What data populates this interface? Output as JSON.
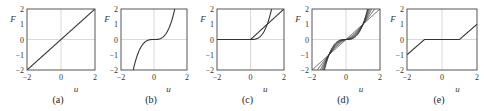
{
  "chart_data": [
    {
      "panel": "(a)",
      "type": "line",
      "xlabel": "u",
      "ylabel": "F",
      "xlim": [
        -2,
        2
      ],
      "ylim": [
        -2,
        2
      ],
      "xticks": [
        "-2",
        "0",
        "2"
      ],
      "yticks": [
        "2",
        "1",
        "0",
        "-1",
        "-2"
      ],
      "grid": "zero-lines",
      "series": [
        {
          "name": "linear",
          "formula": "F = u",
          "x": [
            -2,
            2
          ],
          "y": [
            -2,
            2
          ]
        }
      ]
    },
    {
      "panel": "(b)",
      "type": "line",
      "xlabel": "u",
      "ylabel": "F",
      "xlim": [
        -2,
        2
      ],
      "ylim": [
        -2,
        2
      ],
      "xticks": [
        "-2",
        "0",
        "2"
      ],
      "yticks": [
        "2",
        "1",
        "0",
        "-1",
        "-2"
      ],
      "grid": "zero-lines",
      "series": [
        {
          "name": "cubic",
          "formula": "F = u^3",
          "x": [
            -1.26,
            -1,
            -0.5,
            0,
            0.5,
            1,
            1.26
          ],
          "y": [
            -2,
            -1,
            -0.125,
            0,
            0.125,
            1,
            2
          ]
        }
      ]
    },
    {
      "panel": "(c)",
      "type": "line",
      "xlabel": "u",
      "ylabel": "F",
      "xlim": [
        -2,
        2
      ],
      "ylim": [
        -2,
        2
      ],
      "xticks": [
        "-2",
        "0",
        "2"
      ],
      "yticks": [
        "2",
        "1",
        "0",
        "-1",
        "-2"
      ],
      "grid": "zero-lines",
      "series": [
        {
          "name": "rectified linear",
          "formula": "F = max(0,u)",
          "x": [
            -2,
            0,
            2
          ],
          "y": [
            0,
            0,
            2
          ]
        },
        {
          "name": "rectified cubic",
          "formula": "F = max(0,u)^3",
          "x": [
            -2,
            0,
            0.5,
            1,
            1.26
          ],
          "y": [
            0,
            0,
            0.125,
            1,
            2
          ]
        }
      ]
    },
    {
      "panel": "(d)",
      "type": "line",
      "xlabel": "u",
      "ylabel": "F",
      "xlim": [
        -2,
        2
      ],
      "ylim": [
        -2,
        2
      ],
      "xticks": [
        "-2",
        "0",
        "2"
      ],
      "yticks": [
        "2",
        "1",
        "0",
        "-1",
        "-2"
      ],
      "grid": "zero-lines",
      "series": [
        {
          "name": "p=1",
          "exponent": 1
        },
        {
          "name": "p=1.33",
          "exponent": 1.33
        },
        {
          "name": "p=1.67",
          "exponent": 1.67
        },
        {
          "name": "p=2",
          "exponent": 2
        },
        {
          "name": "p=2.33",
          "exponent": 2.33
        },
        {
          "name": "p=2.67",
          "exponent": 2.67
        },
        {
          "name": "p=3",
          "exponent": 3
        }
      ],
      "formula": "F = sign(u)|u|^p"
    },
    {
      "panel": "(e)",
      "type": "line",
      "xlabel": "u",
      "ylabel": "F",
      "xlim": [
        -2,
        2
      ],
      "ylim": [
        -2,
        2
      ],
      "xticks": [
        "-2",
        "0",
        "2"
      ],
      "yticks": [
        "2",
        "1",
        "0",
        "-1",
        "-2"
      ],
      "grid": "zero-lines",
      "series": [
        {
          "name": "dead-zone",
          "formula": "F = u+1 (u<-1), 0 (|u|<=1), u-1 (u>1)",
          "x": [
            -2,
            -1,
            1,
            2
          ],
          "y": [
            -1,
            0,
            0,
            1
          ]
        }
      ]
    }
  ],
  "panels": [
    {
      "caption": "(a)",
      "xlabel": "u",
      "ylabel": "F",
      "ticks_x": [
        "−2",
        "0",
        "2"
      ],
      "ticks_y": [
        "2",
        "1",
        "0",
        "−1",
        "−2"
      ]
    },
    {
      "caption": "(b)",
      "xlabel": "u",
      "ylabel": "F",
      "ticks_x": [
        "−2",
        "0",
        "2"
      ],
      "ticks_y": [
        "2",
        "1",
        "0",
        "−1",
        "−2"
      ]
    },
    {
      "caption": "(c)",
      "xlabel": "u",
      "ylabel": "F",
      "ticks_x": [
        "−2",
        "0",
        "2"
      ],
      "ticks_y": [
        "2",
        "1",
        "0",
        "−1",
        "−2"
      ]
    },
    {
      "caption": "(d)",
      "xlabel": "u",
      "ylabel": "F",
      "ticks_x": [
        "−2",
        "0",
        "2"
      ],
      "ticks_y": [
        "2",
        "1",
        "0",
        "−1",
        "−2"
      ]
    },
    {
      "caption": "(e)",
      "xlabel": "u",
      "ylabel": "F",
      "ticks_x": [
        "−2",
        "0",
        "2"
      ],
      "ticks_y": [
        "2",
        "1",
        "0",
        "−1",
        "−2"
      ]
    }
  ],
  "colors": {
    "curve": "#333333",
    "frame": "#444444",
    "zero_line": "#c8c8c8"
  }
}
